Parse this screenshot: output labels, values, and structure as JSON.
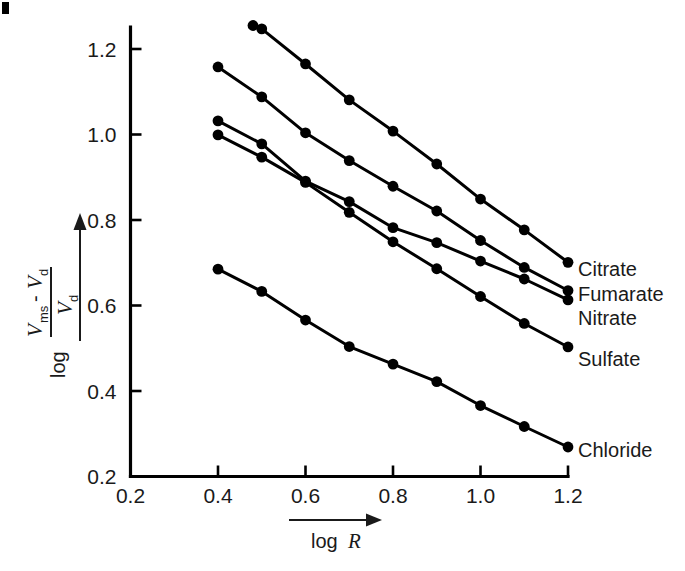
{
  "chart_data": {
    "type": "line",
    "title": "",
    "xlabel": "log R",
    "ylabel": "log (V_ms - V_d)/V_d",
    "xlim": [
      0.2,
      1.2
    ],
    "ylim": [
      0.2,
      1.26
    ],
    "grid": false,
    "legend_position": "right-inline",
    "xticks": [
      "0.2",
      "0.4",
      "0.6",
      "0.8",
      "1.0",
      "1.2"
    ],
    "xtick_values": [
      0.2,
      0.4,
      0.6,
      0.8,
      1.0,
      1.2
    ],
    "yticks": [
      "0.2",
      "0.4",
      "0.6",
      "0.8",
      "1.0",
      "1.2"
    ],
    "ytick_values": [
      0.2,
      0.4,
      0.6,
      0.8,
      1.0,
      1.2
    ],
    "series": [
      {
        "name": "Citrate",
        "x": [
          0.48,
          0.5,
          0.6,
          0.7,
          0.8,
          0.9,
          1.0,
          1.1,
          1.2
        ],
        "values": [
          1.255,
          1.247,
          1.165,
          1.081,
          1.008,
          0.931,
          0.849,
          0.777,
          0.701
        ]
      },
      {
        "name": "Fumarate",
        "x": [
          0.4,
          0.5,
          0.6,
          0.7,
          0.8,
          0.9,
          1.0,
          1.1,
          1.2
        ],
        "values": [
          1.158,
          1.088,
          1.004,
          0.939,
          0.879,
          0.821,
          0.752,
          0.689,
          0.635
        ]
      },
      {
        "name": "Nitrate",
        "x": [
          0.4,
          0.5,
          0.6,
          0.7,
          0.8,
          0.9,
          1.0,
          1.1,
          1.2
        ],
        "values": [
          1.032,
          0.978,
          0.891,
          0.843,
          0.782,
          0.747,
          0.704,
          0.662,
          0.613
        ]
      },
      {
        "name": "Sulfate",
        "x": [
          0.4,
          0.5,
          0.6,
          0.7,
          0.8,
          0.9,
          1.0,
          1.1,
          1.2
        ],
        "values": [
          0.999,
          0.947,
          0.888,
          0.818,
          0.749,
          0.686,
          0.621,
          0.558,
          0.503
        ]
      },
      {
        "name": "Chloride",
        "x": [
          0.4,
          0.5,
          0.6,
          0.7,
          0.8,
          0.9,
          1.0,
          1.1,
          1.2
        ],
        "values": [
          0.685,
          0.633,
          0.566,
          0.504,
          0.463,
          0.422,
          0.366,
          0.317,
          0.269
        ]
      }
    ]
  },
  "axes": {
    "x_axis_label_main": "log",
    "x_axis_label_var": "R",
    "y_axis_label_log": "log",
    "y_axis_numer_v1": "V",
    "y_axis_numer_v1_sub": "ms",
    "y_axis_numer_minus": "-",
    "y_axis_numer_v2": "V",
    "y_axis_numer_v2_sub": "d",
    "y_axis_denom_v": "V",
    "y_axis_denom_sub": "d"
  },
  "colors": {
    "ink": "#000000",
    "text": "#1a1a1a",
    "background": "#ffffff"
  }
}
